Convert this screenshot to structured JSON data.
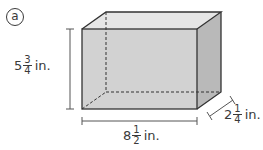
{
  "figure": {
    "label": "a",
    "shape": "rectangular-prism",
    "colors": {
      "front_face": "#d2d2d2",
      "top_face": "#e6e6e6",
      "side_face": "#b9b9b9",
      "edge": "#333333",
      "dimension_line": "#555555"
    },
    "dimensions": {
      "height": {
        "whole": "5",
        "numerator": "3",
        "denominator": "4",
        "unit": "in."
      },
      "length": {
        "whole": "8",
        "numerator": "1",
        "denominator": "2",
        "unit": "in."
      },
      "width": {
        "whole": "2",
        "numerator": "1",
        "denominator": "4",
        "unit": "in."
      }
    }
  }
}
